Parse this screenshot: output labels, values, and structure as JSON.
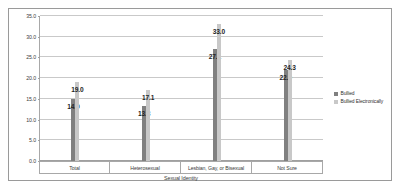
{
  "chart_data": {
    "type": "bar",
    "title": "",
    "subtitle": "",
    "xlabel": "Sexual Identity",
    "ylabel": "",
    "categories": [
      "Total",
      "Heterosexual",
      "Lesbian, Gay, or Bisexual",
      "Not Sure"
    ],
    "series": [
      {
        "name": "Bullied",
        "color": "#808080",
        "values": [
          14.9,
          13.3,
          27.1,
          22.0
        ]
      },
      {
        "name": "Bullied Electronically",
        "color": "#c8c8c8",
        "values": [
          19.0,
          17.1,
          33.0,
          24.3
        ]
      }
    ],
    "ylim": [
      0.0,
      35.0
    ],
    "ytick_step": 5.0,
    "ytick_labels": [
      "0.0",
      "5.0",
      "10.0",
      "15.0",
      "20.0",
      "25.0",
      "30.0",
      "35.0"
    ],
    "grid": true,
    "legend_position": "right",
    "data_labels": true,
    "value_format": "one-decimal"
  },
  "legend": {
    "entries": [
      {
        "label": "Bullied",
        "marker": "filled-square"
      },
      {
        "label": "Bullied Electronically",
        "marker": "filled-square"
      }
    ]
  },
  "axis": {
    "x_title": "Sexual Identity"
  }
}
